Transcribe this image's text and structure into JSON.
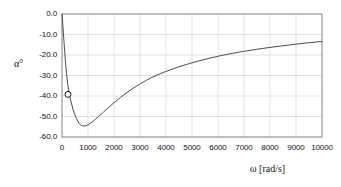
{
  "chart_data": {
    "type": "line",
    "title": "",
    "xlabel": "ω  [rad/s]",
    "ylabel": "α°",
    "xlim": [
      0,
      10000
    ],
    "ylim": [
      -60,
      0
    ],
    "grid": true,
    "legend": null,
    "xticks": [
      0,
      1000,
      2000,
      3000,
      4000,
      5000,
      6000,
      7000,
      8000,
      9000,
      10000
    ],
    "xtick_labels": [
      "0",
      "1000",
      "2000",
      "3000",
      "4000",
      "5000",
      "6000",
      "7000",
      "8000",
      "9000",
      "10000"
    ],
    "yticks": [
      0,
      -10,
      -20,
      -30,
      -40,
      -50,
      -60
    ],
    "ytick_labels": [
      "0.0",
      "-10.0",
      "-20.0",
      "-30.0",
      "-40.0",
      "-50.0",
      "-60.0"
    ],
    "series": [
      {
        "name": "phase",
        "style": "solid-line",
        "color": "#4d4d4d",
        "x": [
          0,
          20,
          50,
          80,
          110,
          140,
          170,
          200,
          230,
          260,
          300,
          340,
          380,
          420,
          460,
          500,
          550,
          600,
          650,
          700,
          750,
          800,
          900,
          1000,
          1100,
          1250,
          1400,
          1600,
          1800,
          2000,
          2250,
          2500,
          2750,
          3000,
          3250,
          3500,
          3750,
          4000,
          4500,
          5000,
          5500,
          6000,
          6500,
          7000,
          7500,
          8000,
          8500,
          9000,
          9500,
          10000
        ],
        "y": [
          0.0,
          -3.4,
          -8.8,
          -14.2,
          -19.4,
          -24.3,
          -28.6,
          -32.2,
          -35.2,
          -37.6,
          -40.2,
          -42.4,
          -44.4,
          -46.3,
          -47.9,
          -49.3,
          -50.9,
          -52.1,
          -53.2,
          -53.9,
          -54.4,
          -54.6,
          -54.6,
          -54.1,
          -53.3,
          -51.8,
          -50.1,
          -47.8,
          -45.5,
          -43.3,
          -40.7,
          -38.3,
          -36.1,
          -34.1,
          -32.3,
          -30.7,
          -29.3,
          -28.0,
          -25.7,
          -23.8,
          -22.1,
          -20.6,
          -19.3,
          -18.2,
          -17.2,
          -16.3,
          -15.5,
          -14.7,
          -14.0,
          -13.4
        ]
      }
    ],
    "markers": [
      {
        "name": "operating-point",
        "shape": "open-circle",
        "x": 230,
        "y": -39.2,
        "facecolor": "#ffffff",
        "edgecolor": "#1a1a1a"
      }
    ],
    "colors": {
      "curve": "#4d4d4d",
      "grid": "#d9d9d9",
      "frame": "#808080",
      "text": "#111111",
      "background": "#ffffff"
    }
  }
}
